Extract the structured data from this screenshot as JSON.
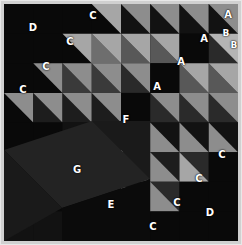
{
  "figure": {
    "kind": "labelled-triangle-grid",
    "width": 242,
    "height": 245,
    "background": "#d0d0d0",
    "board": {
      "x": 4,
      "y": 4,
      "width": 234,
      "height": 237,
      "fill": "#0a0a0a"
    },
    "grid": {
      "cols": 8,
      "rows": 8,
      "cell": 29.25,
      "origin_x": 0,
      "origin_y": 0
    }
  },
  "palette": {
    "black": "#090909",
    "near_black": "#121212",
    "dark": "#1d1d1d",
    "dark_gray": "#2a2a2a",
    "mid_dark": "#3a3a3a",
    "mid": "#585858",
    "gray": "#6e6e6e",
    "light_gray": "#8d8d8d",
    "lighter": "#a6a6a6",
    "light": "#b4b4b4",
    "white": "#ffffff",
    "frame": "#e8e8e8"
  },
  "regions": [
    {
      "id": "A",
      "label": "A",
      "note": "dark square patches, upper right"
    },
    {
      "id": "B",
      "label": "B",
      "note": "split corner cell, top right"
    },
    {
      "id": "C",
      "label": "C",
      "note": "light half-square triangles along both diagonals"
    },
    {
      "id": "D",
      "label": "D",
      "note": "large black field, upper left and lower right"
    },
    {
      "id": "E",
      "label": "E",
      "note": "black field, lower middle"
    },
    {
      "id": "F",
      "label": "F",
      "note": "dark band, centre left"
    },
    {
      "id": "G",
      "label": "G",
      "note": "diagonal stripe, lower left"
    }
  ],
  "labels": [
    {
      "text": "D",
      "x": 33,
      "y": 28,
      "size": "big"
    },
    {
      "text": "C",
      "x": 93,
      "y": 16,
      "size": "big"
    },
    {
      "text": "C",
      "x": 70,
      "y": 42,
      "size": "big"
    },
    {
      "text": "C",
      "x": 46,
      "y": 67,
      "size": "big"
    },
    {
      "text": "C",
      "x": 23,
      "y": 90,
      "size": "big"
    },
    {
      "text": "A",
      "x": 228,
      "y": 15,
      "size": "big"
    },
    {
      "text": "A",
      "x": 204,
      "y": 39,
      "size": "big"
    },
    {
      "text": "B",
      "x": 226,
      "y": 33,
      "size": "small"
    },
    {
      "text": "B",
      "x": 234,
      "y": 45,
      "size": "small"
    },
    {
      "text": "A",
      "x": 181,
      "y": 62,
      "size": "big"
    },
    {
      "text": "A",
      "x": 157,
      "y": 87,
      "size": "big"
    },
    {
      "text": "F",
      "x": 126,
      "y": 120,
      "size": "big"
    },
    {
      "text": "C",
      "x": 222,
      "y": 155,
      "size": "big"
    },
    {
      "text": "C",
      "x": 199,
      "y": 179,
      "size": "big"
    },
    {
      "text": "C",
      "x": 177,
      "y": 203,
      "size": "big"
    },
    {
      "text": "C",
      "x": 153,
      "y": 227,
      "size": "big"
    },
    {
      "text": "D",
      "x": 210,
      "y": 213,
      "size": "big"
    },
    {
      "text": "G",
      "x": 77,
      "y": 170,
      "size": "big"
    },
    {
      "text": "E",
      "x": 111,
      "y": 205,
      "size": "big"
    }
  ],
  "chart_data": {
    "type": "heatmap",
    "grid_cols": 8,
    "grid_rows": 8,
    "legend": [
      "A",
      "B",
      "C",
      "D",
      "E",
      "F",
      "G"
    ],
    "cells": [
      {
        "r": 0,
        "c": 0,
        "split": "none",
        "a": "#090909",
        "b": "#090909"
      },
      {
        "r": 0,
        "c": 1,
        "split": "none",
        "a": "#090909",
        "b": "#090909"
      },
      {
        "r": 0,
        "c": 2,
        "split": "none",
        "a": "#090909",
        "b": "#090909"
      },
      {
        "r": 0,
        "c": 3,
        "split": "tl-br",
        "a": "#090909",
        "b": "#a6a6a6"
      },
      {
        "r": 0,
        "c": 4,
        "split": "tl-br",
        "a": "#121212",
        "b": "#8d8d8d"
      },
      {
        "r": 0,
        "c": 5,
        "split": "tl-br",
        "a": "#121212",
        "b": "#8d8d8d"
      },
      {
        "r": 0,
        "c": 6,
        "split": "tl-br",
        "a": "#121212",
        "b": "#8d8d8d"
      },
      {
        "r": 0,
        "c": 7,
        "split": "tl-br",
        "a": "#121212",
        "b": "#8d8d8d"
      },
      {
        "r": 1,
        "c": 0,
        "split": "none",
        "a": "#090909",
        "b": "#090909"
      },
      {
        "r": 1,
        "c": 1,
        "split": "none",
        "a": "#090909",
        "b": "#090909"
      },
      {
        "r": 1,
        "c": 2,
        "split": "tl-br",
        "a": "#090909",
        "b": "#a6a6a6"
      },
      {
        "r": 1,
        "c": 3,
        "split": "tl-br",
        "a": "#6e6e6e",
        "b": "#a6a6a6"
      },
      {
        "r": 1,
        "c": 4,
        "split": "tl-br",
        "a": "#585858",
        "b": "#a6a6a6"
      },
      {
        "r": 1,
        "c": 5,
        "split": "tl-br",
        "a": "#585858",
        "b": "#a6a6a6"
      },
      {
        "r": 1,
        "c": 6,
        "split": "none",
        "a": "#090909",
        "b": "#090909"
      },
      {
        "r": 1,
        "c": 7,
        "split": "tl-br",
        "a": "#2a2a2a",
        "b": "#b4b4b4"
      },
      {
        "r": 2,
        "c": 0,
        "split": "none",
        "a": "#090909",
        "b": "#090909"
      },
      {
        "r": 2,
        "c": 1,
        "split": "tl-br",
        "a": "#090909",
        "b": "#8d8d8d"
      },
      {
        "r": 2,
        "c": 2,
        "split": "tl-br",
        "a": "#3a3a3a",
        "b": "#8d8d8d"
      },
      {
        "r": 2,
        "c": 3,
        "split": "tl-br",
        "a": "#3a3a3a",
        "b": "#8d8d8d"
      },
      {
        "r": 2,
        "c": 4,
        "split": "tl-br",
        "a": "#2a2a2a",
        "b": "#8d8d8d"
      },
      {
        "r": 2,
        "c": 5,
        "split": "none",
        "a": "#090909",
        "b": "#090909"
      },
      {
        "r": 2,
        "c": 6,
        "split": "tl-br",
        "a": "#585858",
        "b": "#a6a6a6"
      },
      {
        "r": 2,
        "c": 7,
        "split": "tl-br",
        "a": "#585858",
        "b": "#a6a6a6"
      },
      {
        "r": 3,
        "c": 0,
        "split": "tl-br",
        "a": "#090909",
        "b": "#8d8d8d"
      },
      {
        "r": 3,
        "c": 1,
        "split": "tl-br",
        "a": "#1d1d1d",
        "b": "#8d8d8d"
      },
      {
        "r": 3,
        "c": 2,
        "split": "tl-br",
        "a": "#1d1d1d",
        "b": "#8d8d8d"
      },
      {
        "r": 3,
        "c": 3,
        "split": "tl-br",
        "a": "#1d1d1d",
        "b": "#8d8d8d"
      },
      {
        "r": 3,
        "c": 4,
        "split": "none",
        "a": "#090909",
        "b": "#090909"
      },
      {
        "r": 3,
        "c": 5,
        "split": "tl-br",
        "a": "#2a2a2a",
        "b": "#8d8d8d"
      },
      {
        "r": 3,
        "c": 6,
        "split": "tl-br",
        "a": "#2a2a2a",
        "b": "#8d8d8d"
      },
      {
        "r": 3,
        "c": 7,
        "split": "tl-br",
        "a": "#2a2a2a",
        "b": "#8d8d8d"
      },
      {
        "r": 4,
        "c": 0,
        "split": "none",
        "a": "#090909",
        "b": "#090909"
      },
      {
        "r": 4,
        "c": 1,
        "split": "none",
        "a": "#090909",
        "b": "#090909"
      },
      {
        "r": 4,
        "c": 2,
        "split": "none",
        "a": "#121212",
        "b": "#121212"
      },
      {
        "r": 4,
        "c": 3,
        "split": "none",
        "a": "#121212",
        "b": "#121212"
      },
      {
        "r": 4,
        "c": 4,
        "split": "bl-tr",
        "a": "#090909",
        "b": "#8d8d8d"
      },
      {
        "r": 4,
        "c": 5,
        "split": "bl-tr",
        "a": "#121212",
        "b": "#8d8d8d"
      },
      {
        "r": 4,
        "c": 6,
        "split": "bl-tr",
        "a": "#121212",
        "b": "#8d8d8d"
      },
      {
        "r": 4,
        "c": 7,
        "split": "bl-tr",
        "a": "#121212",
        "b": "#8d8d8d"
      },
      {
        "r": 5,
        "c": 0,
        "split": "none",
        "a": "#090909",
        "b": "#090909"
      },
      {
        "r": 5,
        "c": 1,
        "split": "none",
        "a": "#090909",
        "b": "#090909"
      },
      {
        "r": 5,
        "c": 2,
        "split": "none",
        "a": "#121212",
        "b": "#121212"
      },
      {
        "r": 5,
        "c": 3,
        "split": "none",
        "a": "#121212",
        "b": "#121212"
      },
      {
        "r": 5,
        "c": 4,
        "split": "bl-tr",
        "a": "#1d1d1d",
        "b": "#8d8d8d"
      },
      {
        "r": 5,
        "c": 5,
        "split": "bl-tr",
        "a": "#1d1d1d",
        "b": "#8d8d8d"
      },
      {
        "r": 5,
        "c": 6,
        "split": "bl-tr",
        "a": "#2a2a2a",
        "b": "#a6a6a6"
      },
      {
        "r": 5,
        "c": 7,
        "split": "none",
        "a": "#090909",
        "b": "#090909"
      },
      {
        "r": 6,
        "c": 0,
        "split": "none",
        "a": "#121212",
        "b": "#121212"
      },
      {
        "r": 6,
        "c": 1,
        "split": "none",
        "a": "#090909",
        "b": "#090909"
      },
      {
        "r": 6,
        "c": 2,
        "split": "none",
        "a": "#090909",
        "b": "#090909"
      },
      {
        "r": 6,
        "c": 3,
        "split": "none",
        "a": "#090909",
        "b": "#090909"
      },
      {
        "r": 6,
        "c": 4,
        "split": "bl-tr",
        "a": "#1d1d1d",
        "b": "#8d8d8d"
      },
      {
        "r": 6,
        "c": 5,
        "split": "bl-tr",
        "a": "#2a2a2a",
        "b": "#8d8d8d"
      },
      {
        "r": 6,
        "c": 6,
        "split": "none",
        "a": "#090909",
        "b": "#090909"
      },
      {
        "r": 6,
        "c": 7,
        "split": "none",
        "a": "#090909",
        "b": "#090909"
      },
      {
        "r": 7,
        "c": 0,
        "split": "none",
        "a": "#121212",
        "b": "#121212"
      },
      {
        "r": 7,
        "c": 1,
        "split": "none",
        "a": "#121212",
        "b": "#121212"
      },
      {
        "r": 7,
        "c": 2,
        "split": "none",
        "a": "#090909",
        "b": "#090909"
      },
      {
        "r": 7,
        "c": 3,
        "split": "none",
        "a": "#090909",
        "b": "#090909"
      },
      {
        "r": 7,
        "c": 4,
        "split": "bl-tr",
        "a": "#090909",
        "b": "#8d8d8d"
      },
      {
        "r": 7,
        "c": 5,
        "split": "none",
        "a": "#090909",
        "b": "#090909"
      },
      {
        "r": 7,
        "c": 6,
        "split": "none",
        "a": "#090909",
        "b": "#090909"
      },
      {
        "r": 7,
        "c": 7,
        "split": "none",
        "a": "#090909",
        "b": "#090909"
      }
    ],
    "overlays": [
      {
        "name": "region-F-band",
        "points": "88,117 146,117 146,175 117,146 88,117",
        "fill": "#1a1a1a"
      },
      {
        "name": "region-G-stripe",
        "points": "0,146 88,117 146,175 58,204 0,146",
        "fill": "#232323"
      },
      {
        "name": "region-E-field",
        "points": "146,175 146,237 58,237 58,204 146,175",
        "fill": "#0b0b0b"
      },
      {
        "name": "region-lowerleft-dark",
        "points": "0,146 58,204 0,237 0,146",
        "fill": "#1a1a1a"
      }
    ]
  }
}
